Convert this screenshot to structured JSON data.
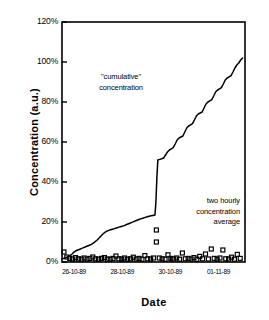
{
  "chart_data": {
    "type": "line",
    "title": "",
    "xlabel": "Date",
    "ylabel": "Concentration (a.u.)",
    "ylim": [
      0,
      120
    ],
    "yunit": "%",
    "ytick_labels": [
      "0%",
      "20%",
      "40%",
      "60%",
      "80%",
      "100%",
      "120%"
    ],
    "ytick_values": [
      0,
      20,
      40,
      60,
      80,
      100,
      120
    ],
    "xtick_labels": [
      "26-10-89",
      "28-10-89",
      "30-10-89",
      "01-11-89"
    ],
    "xtick_values": [
      0.5,
      2.5,
      4.5,
      6.5
    ],
    "xlim": [
      0,
      7.6
    ],
    "grid": false,
    "legend_position": "none",
    "frame": "box",
    "annotations": [
      {
        "name": "cumulative-concentration",
        "lines": [
          "\"cumulative\"",
          "concentration"
        ],
        "x": 1.4,
        "y": 88
      },
      {
        "name": "two-hourly-average",
        "lines": [
          "two hourly",
          "concentration",
          "average"
        ],
        "x": 6.2,
        "y": 26
      }
    ],
    "series": [
      {
        "name": "\"cumulative\" concentration",
        "type": "line",
        "style": "solid",
        "color": "#000000",
        "marker": "none",
        "x": [
          0.0,
          0.12,
          0.24,
          0.34,
          0.42,
          0.5,
          0.58,
          0.66,
          0.74,
          0.82,
          0.9,
          0.98,
          1.06,
          1.14,
          1.22,
          1.3,
          1.38,
          1.46,
          1.54,
          1.62,
          1.7,
          1.78,
          1.86,
          1.94,
          2.02,
          2.1,
          2.18,
          2.26,
          2.34,
          2.42,
          2.5,
          2.58,
          2.66,
          2.74,
          2.82,
          2.9,
          2.98,
          3.06,
          3.14,
          3.22,
          3.3,
          3.38,
          3.46,
          3.54,
          3.62,
          3.7,
          3.78,
          3.86,
          3.9,
          3.94,
          3.98,
          4.06,
          4.14,
          4.22,
          4.3,
          4.38,
          4.46,
          4.54,
          4.62,
          4.7,
          4.78,
          4.86,
          4.94,
          5.02,
          5.1,
          5.18,
          5.26,
          5.34,
          5.42,
          5.5,
          5.58,
          5.66,
          5.74,
          5.82,
          5.9,
          5.98,
          6.06,
          6.14,
          6.22,
          6.3,
          6.38,
          6.46,
          6.54,
          6.62,
          6.7,
          6.78,
          6.86,
          6.94,
          7.02,
          7.1,
          7.18,
          7.26,
          7.34,
          7.42,
          7.5
        ],
        "y": [
          1.5,
          2.0,
          2.6,
          3.2,
          4.0,
          5.0,
          5.6,
          6.0,
          6.4,
          6.8,
          7.2,
          7.6,
          8.0,
          8.4,
          8.8,
          9.4,
          10.2,
          11.0,
          12.0,
          13.0,
          14.0,
          14.8,
          15.4,
          15.8,
          16.1,
          16.4,
          16.7,
          17.0,
          17.3,
          17.6,
          17.9,
          18.2,
          18.6,
          19.0,
          19.4,
          19.8,
          20.2,
          20.6,
          21.0,
          21.4,
          21.7,
          22.0,
          22.3,
          22.6,
          22.9,
          23.1,
          23.3,
          23.5,
          30.0,
          42.0,
          51.0,
          51.3,
          51.6,
          52.0,
          53.5,
          55.0,
          56.0,
          56.6,
          57.2,
          59.0,
          61.0,
          62.0,
          62.5,
          63.0,
          65.0,
          67.0,
          68.0,
          68.6,
          69.2,
          71.0,
          73.0,
          74.0,
          74.5,
          75.0,
          77.0,
          79.0,
          80.0,
          80.6,
          81.2,
          83.0,
          85.0,
          86.0,
          86.6,
          87.2,
          89.0,
          91.0,
          92.0,
          92.6,
          93.2,
          95.0,
          97.0,
          98.5,
          99.5,
          101.0,
          102.0
        ]
      },
      {
        "name": "two hourly concentration average",
        "type": "scatter",
        "marker": "open-square",
        "color": "#000000",
        "x": [
          0.08,
          0.2,
          0.32,
          0.44,
          0.56,
          0.68,
          0.8,
          0.92,
          1.04,
          1.16,
          1.28,
          1.4,
          1.52,
          1.64,
          1.76,
          1.88,
          2.0,
          2.12,
          2.24,
          2.36,
          2.48,
          2.6,
          2.72,
          2.84,
          2.96,
          3.08,
          3.2,
          3.32,
          3.44,
          3.56,
          3.68,
          3.8,
          3.92,
          3.92,
          4.04,
          4.16,
          4.28,
          4.4,
          4.52,
          4.64,
          4.76,
          4.88,
          5.0,
          5.12,
          5.24,
          5.36,
          5.48,
          5.6,
          5.72,
          5.84,
          5.96,
          6.08,
          6.2,
          6.32,
          6.44,
          6.56,
          6.68,
          6.8,
          6.92,
          7.04,
          7.16,
          7.28,
          7.4
        ],
        "y": [
          5.0,
          2.5,
          1.8,
          1.5,
          2.2,
          1.6,
          1.4,
          2.0,
          1.5,
          1.8,
          2.5,
          1.6,
          1.4,
          1.8,
          2.2,
          1.5,
          1.4,
          1.8,
          3.0,
          1.6,
          1.5,
          2.0,
          1.4,
          1.6,
          2.4,
          1.5,
          1.8,
          1.4,
          3.2,
          1.6,
          1.5,
          2.0,
          16.0,
          10.0,
          2.0,
          1.6,
          1.4,
          3.6,
          1.8,
          1.5,
          2.0,
          1.4,
          4.5,
          1.6,
          1.8,
          1.5,
          2.2,
          1.4,
          2.8,
          1.6,
          4.0,
          1.5,
          6.5,
          1.8,
          1.4,
          2.0,
          6.0,
          1.6,
          1.5,
          2.4,
          1.4,
          3.8,
          1.8
        ]
      }
    ]
  },
  "axes": {
    "ylabel": "Concentration (a.u.)",
    "xlabel": "Date"
  }
}
